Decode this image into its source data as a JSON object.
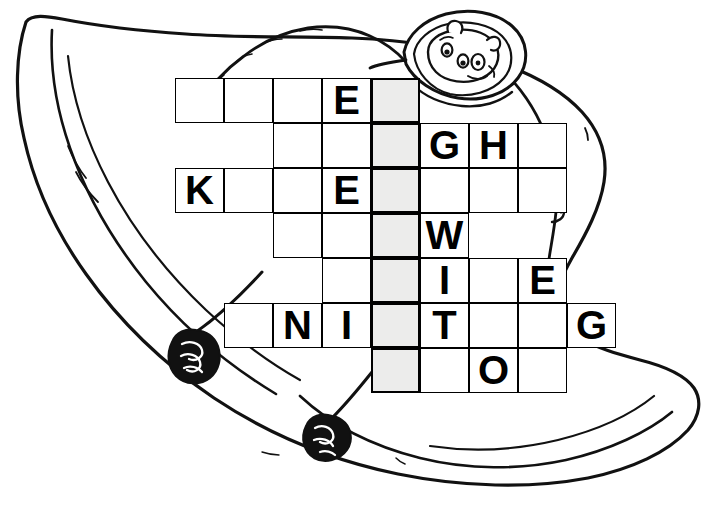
{
  "artwork": {
    "title": "Hand-drawn cartoon animal holding a crossword grid",
    "description": "Line drawing of a large wide-bodied animal seen from above, with a small cartoon face peeking out of a hood at the upper right and two dark hooves at the lower left",
    "line_color": "#111111",
    "fill_color": "#ffffff"
  },
  "puzzle": {
    "type": "crossword",
    "shaded_color": "#ececeb",
    "cell_color": "#ffffff",
    "border_color": "#000000",
    "cell_width": 49,
    "cell_height": 45,
    "origin_x": 175,
    "origin_y": 78,
    "shaded_column_index": 4,
    "rows": [
      {
        "index": 0,
        "start_col": 0,
        "cells": [
          {
            "col": 0,
            "letter": "",
            "shaded": false
          },
          {
            "col": 1,
            "letter": "",
            "shaded": false
          },
          {
            "col": 2,
            "letter": "",
            "shaded": false
          },
          {
            "col": 3,
            "letter": "E",
            "shaded": false
          },
          {
            "col": 4,
            "letter": "",
            "shaded": true
          }
        ]
      },
      {
        "index": 1,
        "start_col": 2,
        "cells": [
          {
            "col": 2,
            "letter": "",
            "shaded": false
          },
          {
            "col": 3,
            "letter": "",
            "shaded": false
          },
          {
            "col": 4,
            "letter": "",
            "shaded": true
          },
          {
            "col": 5,
            "letter": "G",
            "shaded": false
          },
          {
            "col": 6,
            "letter": "H",
            "shaded": false
          },
          {
            "col": 7,
            "letter": "",
            "shaded": false
          }
        ]
      },
      {
        "index": 2,
        "start_col": 0,
        "cells": [
          {
            "col": 0,
            "letter": "K",
            "shaded": false
          },
          {
            "col": 1,
            "letter": "",
            "shaded": false
          },
          {
            "col": 2,
            "letter": "",
            "shaded": false
          },
          {
            "col": 3,
            "letter": "E",
            "shaded": false
          },
          {
            "col": 4,
            "letter": "",
            "shaded": true
          },
          {
            "col": 5,
            "letter": "",
            "shaded": false
          },
          {
            "col": 6,
            "letter": "",
            "shaded": false
          },
          {
            "col": 7,
            "letter": "",
            "shaded": false
          }
        ]
      },
      {
        "index": 3,
        "start_col": 2,
        "cells": [
          {
            "col": 2,
            "letter": "",
            "shaded": false
          },
          {
            "col": 3,
            "letter": "",
            "shaded": false
          },
          {
            "col": 4,
            "letter": "",
            "shaded": true
          },
          {
            "col": 5,
            "letter": "W",
            "shaded": false
          }
        ]
      },
      {
        "index": 4,
        "start_col": 3,
        "cells": [
          {
            "col": 3,
            "letter": "",
            "shaded": false
          },
          {
            "col": 4,
            "letter": "",
            "shaded": true
          },
          {
            "col": 5,
            "letter": "I",
            "shaded": false
          },
          {
            "col": 6,
            "letter": "",
            "shaded": false
          },
          {
            "col": 7,
            "letter": "E",
            "shaded": false
          }
        ]
      },
      {
        "index": 5,
        "start_col": 1,
        "cells": [
          {
            "col": 1,
            "letter": "",
            "shaded": false
          },
          {
            "col": 2,
            "letter": "N",
            "shaded": false
          },
          {
            "col": 3,
            "letter": "I",
            "shaded": false
          },
          {
            "col": 4,
            "letter": "",
            "shaded": true
          },
          {
            "col": 5,
            "letter": "T",
            "shaded": false
          },
          {
            "col": 6,
            "letter": "",
            "shaded": false
          },
          {
            "col": 7,
            "letter": "",
            "shaded": false
          },
          {
            "col": 8,
            "letter": "G",
            "shaded": false
          }
        ]
      },
      {
        "index": 6,
        "start_col": 4,
        "cells": [
          {
            "col": 4,
            "letter": "",
            "shaded": true
          },
          {
            "col": 5,
            "letter": "",
            "shaded": false
          },
          {
            "col": 6,
            "letter": "O",
            "shaded": false
          },
          {
            "col": 7,
            "letter": "",
            "shaded": false
          }
        ]
      }
    ],
    "filled_letters": [
      "E",
      "G",
      "H",
      "K",
      "E",
      "W",
      "I",
      "E",
      "N",
      "I",
      "T",
      "G",
      "O"
    ]
  }
}
